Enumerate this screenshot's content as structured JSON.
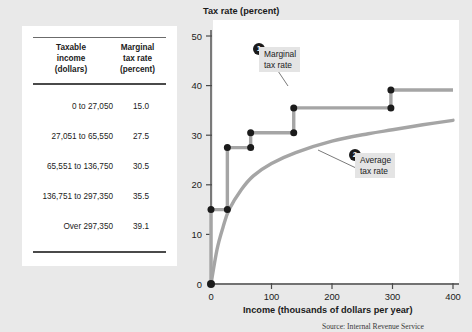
{
  "figure": {
    "source_note": "Source: Internal Revenue Service"
  },
  "table": {
    "headers": {
      "col1": [
        "Taxable",
        "income",
        "(dollars)"
      ],
      "col2": [
        "Marginal",
        "tax rate",
        "(percent)"
      ]
    },
    "rows": [
      {
        "bracket": "0 to 27,050",
        "rate": "15.0"
      },
      {
        "bracket": "27,051 to 65,550",
        "rate": "27.5"
      },
      {
        "bracket": "65,551 to 136,750",
        "rate": "30.5"
      },
      {
        "bracket": "136,751 to 297,350",
        "rate": "35.5"
      },
      {
        "bracket": "Over 297,350",
        "rate": "39.1"
      }
    ]
  },
  "callouts": [
    {
      "badge": "1",
      "line1": "Marginal",
      "line2": "tax rate"
    },
    {
      "badge": "2",
      "line1": "Average",
      "line2": "tax rate"
    }
  ],
  "chart_data": {
    "type": "line",
    "title": "Tax rate (percent)",
    "xlabel": "Income (thousands of dollars per year)",
    "ylabel": "Tax rate (percent)",
    "xlim": [
      0,
      400
    ],
    "ylim": [
      0,
      50
    ],
    "xticks": [
      0,
      100,
      200,
      300,
      400
    ],
    "yticks": [
      0,
      10,
      20,
      30,
      40,
      50
    ],
    "xtick_labels": [
      "0",
      "100",
      "200",
      "300",
      "400"
    ],
    "ytick_labels": [
      "0",
      "10",
      "20",
      "30",
      "40",
      "50"
    ],
    "grid": false,
    "legend": "annotations",
    "series": [
      {
        "name": "Marginal tax rate",
        "style": "step",
        "color": "#a5a5a5",
        "breakpoints_x": [
          0,
          27.05,
          65.55,
          136.75,
          297.35,
          400
        ],
        "values": [
          15.0,
          27.5,
          30.5,
          35.5,
          39.1
        ],
        "points": [
          {
            "x": 0,
            "y": 0
          },
          {
            "x": 0,
            "y": 15.0
          },
          {
            "x": 27.05,
            "y": 15.0
          },
          {
            "x": 27.05,
            "y": 27.5
          },
          {
            "x": 65.55,
            "y": 27.5
          },
          {
            "x": 65.55,
            "y": 30.5
          },
          {
            "x": 136.75,
            "y": 30.5
          },
          {
            "x": 136.75,
            "y": 35.5
          },
          {
            "x": 297.35,
            "y": 35.5
          },
          {
            "x": 297.35,
            "y": 39.1
          },
          {
            "x": 400,
            "y": 39.1
          }
        ]
      },
      {
        "name": "Average tax rate",
        "style": "smooth",
        "color": "#a5a5a5",
        "points": [
          {
            "x": 0,
            "y": 0
          },
          {
            "x": 10,
            "y": 7.0
          },
          {
            "x": 20,
            "y": 11.5
          },
          {
            "x": 30,
            "y": 15.0
          },
          {
            "x": 50,
            "y": 19.0
          },
          {
            "x": 70,
            "y": 21.8
          },
          {
            "x": 100,
            "y": 24.3
          },
          {
            "x": 140,
            "y": 26.5
          },
          {
            "x": 200,
            "y": 28.8
          },
          {
            "x": 260,
            "y": 30.3
          },
          {
            "x": 300,
            "y": 31.1
          },
          {
            "x": 350,
            "y": 32.1
          },
          {
            "x": 400,
            "y": 33.0
          }
        ]
      }
    ]
  }
}
